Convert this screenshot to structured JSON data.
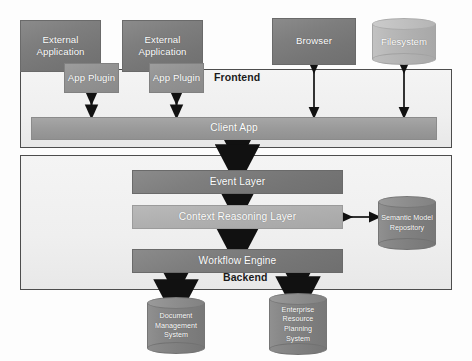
{
  "diagram": {
    "zones": [
      {
        "id": "frontend",
        "label": "Frontend"
      },
      {
        "id": "backend",
        "label": "Backend"
      }
    ],
    "frontend": {
      "external_applications": [
        {
          "label": "External Application"
        },
        {
          "label": "External Application"
        }
      ],
      "app_plugins": [
        {
          "label": "App Plugin"
        },
        {
          "label": "App Plugin"
        }
      ],
      "browser": {
        "label": "Browser"
      },
      "filesystem": {
        "label": "Filesystem"
      },
      "client_app": {
        "label": "Client App"
      }
    },
    "backend": {
      "layers": [
        {
          "label": "Event Layer"
        },
        {
          "label": "Context Reasoning Layer"
        },
        {
          "label": "Workflow Engine"
        }
      ],
      "semantic_model_repository": {
        "label": "Semantic Model Repository"
      },
      "external_systems": [
        {
          "label": "Document Management System"
        },
        {
          "label": "Enterprise Resource Planning System"
        }
      ]
    },
    "connections": [
      {
        "from": "App Plugin",
        "to": "Client App",
        "kind": "bidirectional"
      },
      {
        "from": "App Plugin",
        "to": "Client App",
        "kind": "bidirectional"
      },
      {
        "from": "Browser",
        "to": "Client App",
        "kind": "bidirectional"
      },
      {
        "from": "Filesystem",
        "to": "Client App",
        "kind": "bidirectional"
      },
      {
        "from": "Client App",
        "to": "Event Layer",
        "kind": "bidirectional"
      },
      {
        "from": "Event Layer",
        "to": "Context Reasoning Layer",
        "kind": "bidirectional"
      },
      {
        "from": "Context Reasoning Layer",
        "to": "Workflow Engine",
        "kind": "bidirectional"
      },
      {
        "from": "Context Reasoning Layer",
        "to": "Semantic Model Repository",
        "kind": "bidirectional"
      },
      {
        "from": "Workflow Engine",
        "to": "Document Management System",
        "kind": "bidirectional"
      },
      {
        "from": "Workflow Engine",
        "to": "Enterprise Resource Planning System",
        "kind": "bidirectional"
      }
    ],
    "colors": {
      "dark_node": "#7e7e7e",
      "mid_node": "#939393",
      "light_node": "#b0b0b0",
      "bar_node": "#9a9a9a",
      "container_border": "#4d4d4d",
      "container_fill": "#efefef",
      "arrow": "#111111",
      "node_text": "#ffffff",
      "zone_text": "#1b1b1b"
    }
  }
}
